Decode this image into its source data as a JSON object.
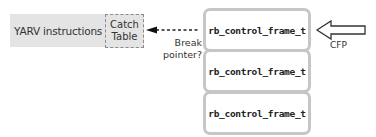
{
  "yarv": {
    "label": "YARV instructions"
  },
  "catch_table": {
    "label": "Catch\nTable"
  },
  "break_pointer": {
    "label": "Break\npointer?"
  },
  "frames": [
    {
      "label": "rb_control_frame_t"
    },
    {
      "label": "rb_control_frame_t"
    },
    {
      "label": "rb_control_frame_t"
    }
  ],
  "cfp": {
    "label": "CFP"
  },
  "colors": {
    "gray_fill": "#e4e4e4",
    "frame_border": "#c6c6c6",
    "text": "#333333"
  }
}
